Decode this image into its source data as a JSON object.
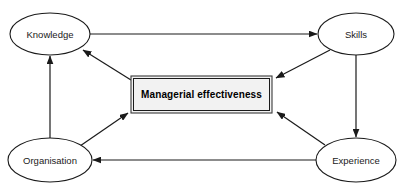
{
  "diagram": {
    "background_color": "#ffffff",
    "line_color": "#1a1a1a",
    "box_fill_color": "#f2f2f2",
    "nodes": [
      {
        "id": "knowledge",
        "label": "Knowledge",
        "shape": "ellipse",
        "cx": 50,
        "cy": 34,
        "rx": 40,
        "ry": 21
      },
      {
        "id": "skills",
        "label": "Skills",
        "shape": "ellipse",
        "cx": 356,
        "cy": 34,
        "rx": 38,
        "ry": 21
      },
      {
        "id": "organisation",
        "label": "Organisation",
        "shape": "ellipse",
        "cx": 50,
        "cy": 160,
        "rx": 42,
        "ry": 22
      },
      {
        "id": "experience",
        "label": "Experience",
        "shape": "ellipse",
        "cx": 356,
        "cy": 160,
        "rx": 40,
        "ry": 22
      },
      {
        "id": "effectiveness",
        "label": "Managerial effectiveness",
        "shape": "rectangle",
        "x": 131,
        "y": 76,
        "width": 141,
        "height": 37
      }
    ],
    "edges": [
      {
        "id": "knowledge-to-skills",
        "from": "knowledge",
        "to": "skills",
        "direction": "right"
      },
      {
        "id": "skills-to-experience",
        "from": "skills",
        "to": "experience",
        "direction": "down"
      },
      {
        "id": "experience-to-organisation",
        "from": "experience",
        "to": "organisation",
        "direction": "left"
      },
      {
        "id": "organisation-to-knowledge",
        "from": "organisation",
        "to": "knowledge",
        "direction": "up"
      },
      {
        "id": "effectiveness-to-knowledge",
        "from": "effectiveness",
        "to": "knowledge",
        "direction": "up-left"
      },
      {
        "id": "skills-to-effectiveness",
        "from": "skills",
        "to": "effectiveness",
        "direction": "down-left"
      },
      {
        "id": "organisation-to-effectiveness",
        "from": "organisation",
        "to": "effectiveness",
        "direction": "up-right"
      },
      {
        "id": "experience-to-effectiveness",
        "from": "experience",
        "to": "effectiveness",
        "direction": "up-left"
      }
    ]
  }
}
